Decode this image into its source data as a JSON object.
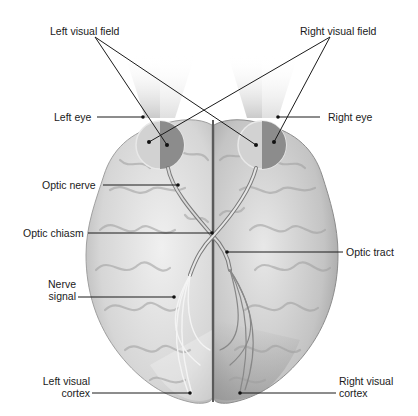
{
  "labels": {
    "left_visual_field": "Left visual field",
    "right_visual_field": "Right visual field",
    "left_eye": "Left eye",
    "right_eye": "Right eye",
    "optic_nerve": "Optic nerve",
    "optic_chiasm": "Optic chiasm",
    "optic_tract": "Optic tract",
    "nerve_signal_1": "Nerve",
    "nerve_signal_2": "signal",
    "left_visual_cortex_1": "Left visual",
    "left_visual_cortex_2": "cortex",
    "right_visual_cortex_1": "Right visual",
    "right_visual_cortex_2": "cortex"
  },
  "colors": {
    "brain_light": "#e6e6e6",
    "brain_mid": "#c8c8c8",
    "brain_dark": "#9a9a9a",
    "right_hemisphere_shade": "#a8a8a8",
    "eye_light": "#cfcfcf",
    "eye_dark": "#8a8a8a",
    "line": "#1a1a1a"
  }
}
